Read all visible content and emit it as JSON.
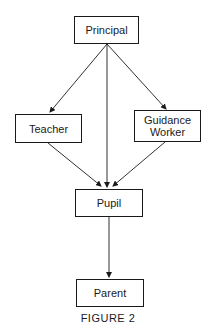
{
  "diagram": {
    "nodes": [
      {
        "id": "principal",
        "label": "Principal"
      },
      {
        "id": "teacher",
        "label": "Teacher"
      },
      {
        "id": "guidance",
        "label": "Guidance\nWorker"
      },
      {
        "id": "pupil",
        "label": "Pupil"
      },
      {
        "id": "parent",
        "label": "Parent"
      }
    ],
    "edges": [
      {
        "from": "principal",
        "to": "teacher"
      },
      {
        "from": "principal",
        "to": "pupil"
      },
      {
        "from": "principal",
        "to": "guidance"
      },
      {
        "from": "teacher",
        "to": "pupil"
      },
      {
        "from": "guidance",
        "to": "pupil"
      },
      {
        "from": "pupil",
        "to": "parent"
      }
    ],
    "caption": "FIGURE 2"
  },
  "labels": {
    "principal": "Principal",
    "teacher": "Teacher",
    "guidance_line1": "Guidance",
    "guidance_line2": "Worker",
    "pupil": "Pupil",
    "parent": "Parent",
    "caption": "FIGURE 2"
  },
  "colors": {
    "line": "#1a1a1a",
    "background": "#ffffff"
  }
}
